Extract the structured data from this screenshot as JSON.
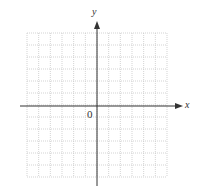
{
  "diagram": {
    "type": "coordinate-grid",
    "x_axis_label": "x",
    "y_axis_label": "y",
    "origin_label": "0",
    "grid": {
      "columns": 12,
      "rows": 12,
      "left": 27,
      "top": 33,
      "right": 167,
      "bottom": 177,
      "line_color": "#c8c8c8",
      "line_style": "dotted"
    },
    "axes": {
      "x_axis_y": 106,
      "y_axis_x": 97,
      "color": "#333333"
    }
  }
}
